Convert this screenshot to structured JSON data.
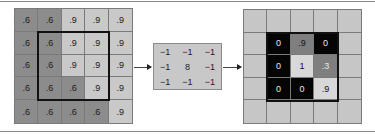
{
  "colors": {
    "dark": "#8c8c8c",
    "light": "#c9c9c9",
    "black": "#050505",
    "mid": "#7f7f7f",
    "bright": "#d8d8d8",
    "empty": "#c6c6c6"
  },
  "input": {
    "rows": [
      [
        ".6",
        ".6",
        ".9",
        ".9",
        ".9"
      ],
      [
        ".6",
        ".6",
        ".9",
        ".9",
        ".9"
      ],
      [
        ".6",
        ".6",
        ".9",
        ".9",
        ".9"
      ],
      [
        ".6",
        ".6",
        ".6",
        ".9",
        ".9"
      ],
      [
        ".6",
        ".6",
        ".6",
        ".6",
        ".9"
      ]
    ],
    "window": {
      "row": 1,
      "col": 1,
      "size": 3
    }
  },
  "kernel": {
    "rows": [
      [
        "−1",
        "−1",
        "−1"
      ],
      [
        "−1",
        "8",
        "−1"
      ],
      [
        "−1",
        "−1",
        "−1"
      ]
    ]
  },
  "output": {
    "rows": [
      [
        "",
        "",
        "",
        "",
        ""
      ],
      [
        "",
        "0",
        ".9",
        "0",
        ""
      ],
      [
        "",
        "0",
        "1",
        ".3",
        ""
      ],
      [
        "",
        "0",
        "0",
        ".9",
        ""
      ],
      [
        "",
        "",
        "",
        "",
        ""
      ]
    ],
    "window": {
      "row": 1,
      "col": 1,
      "size": 3
    }
  }
}
